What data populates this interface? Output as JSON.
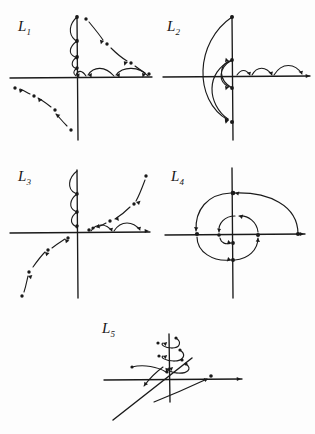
{
  "figure": {
    "title": "",
    "background_color": "#fdfdfd",
    "ink_color": "#1a1a1a"
  },
  "panels": [
    {
      "id": "L1",
      "label_text": "L",
      "label_sub": "1",
      "caption": "Orbits converging to origin along both axes with dotted orbit in third quadrant",
      "axes": {
        "x_label": "",
        "y_label": ""
      },
      "features": [
        "vertical axis arcs stepping downward toward origin",
        "horizontal axis arcs stepping leftward toward origin",
        "dotted diagonal orbit in first quadrant moving down-right",
        "dotted diagonal orbit in third quadrant moving up-left"
      ]
    },
    {
      "id": "L2",
      "label_text": "L",
      "label_sub": "2",
      "caption": "Large left-hand arcs linking points on vertical axis, small arcs along positive x-axis",
      "axes": {
        "x_label": "",
        "y_label": ""
      },
      "features": [
        "large arc from top of vertical axis sweeping left to bottom",
        "medium arc between inner axis points",
        "small arcs marching right along the positive horizontal axis"
      ]
    },
    {
      "id": "L3",
      "label_text": "L",
      "label_sub": "3",
      "caption": "Arcs descending vertical axis, arcs advancing on positive x-axis, dotted orbits on a diagonal",
      "axes": {
        "x_label": "",
        "y_label": ""
      },
      "features": [
        "arcs descending along upper vertical axis toward origin",
        "arcs advancing rightward along positive horizontal axis",
        "dotted orbit entering from upper right toward origin",
        "dotted orbit leaving toward lower left"
      ]
    },
    {
      "id": "L4",
      "label_text": "L",
      "label_sub": "4",
      "caption": "Inward spiral through points on both axes at decreasing radii",
      "axes": {
        "x_label": "",
        "y_label": ""
      },
      "features": [
        "outer spiral arc from right axis over the top to the left axis",
        "successive inner spiral arcs of decreasing radius",
        "marked points on each axis at decreasing distance from origin"
      ]
    },
    {
      "id": "L5",
      "label_text": "L",
      "label_sub": "5",
      "caption": "Spiralling orbits climbing the vertical axis with a slanted line through the origin",
      "axes": {
        "x_label": "",
        "y_label": ""
      },
      "features": [
        "stacked spiral loops around the upper vertical axis",
        "dotted points on each loop",
        "slanted straight line crossing the horizontal axis through the origin",
        "arrow curving to the right along the horizontal axis"
      ]
    }
  ]
}
